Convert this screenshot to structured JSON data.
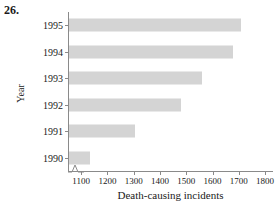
{
  "figure": {
    "problem_number": "26.",
    "bar_color": "#d4d4d4",
    "axis_color": "#8a8a8a",
    "background": "#ffffff"
  },
  "chart_data": {
    "type": "bar",
    "orientation": "horizontal",
    "title": "",
    "xlabel": "Death-causing incidents",
    "ylabel": "Year",
    "categories": [
      "1990",
      "1991",
      "1992",
      "1993",
      "1994",
      "1995"
    ],
    "values": [
      1130,
      1300,
      1475,
      1555,
      1675,
      1705
    ],
    "xlim": [
      1050,
      1830
    ],
    "xticks": [
      1100,
      1200,
      1300,
      1400,
      1500,
      1600,
      1700,
      1800
    ],
    "xtick_labels": [
      "1100",
      "1200",
      "1300",
      "1400",
      "1500",
      "1600",
      "1700",
      "1800"
    ],
    "axis_break": true,
    "grid": false,
    "legend": null,
    "series": [
      {
        "name": "Death-causing incidents",
        "points": [
          {
            "category": "1995",
            "value": 1705
          },
          {
            "category": "1994",
            "value": 1675
          },
          {
            "category": "1993",
            "value": 1555
          },
          {
            "category": "1992",
            "value": 1475
          },
          {
            "category": "1991",
            "value": 1300
          },
          {
            "category": "1990",
            "value": 1130
          }
        ]
      }
    ]
  }
}
